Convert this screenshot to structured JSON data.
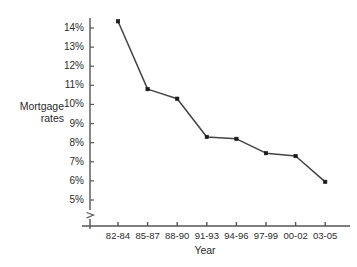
{
  "chart_data": {
    "type": "line",
    "title": "",
    "xlabel": "Year",
    "ylabel": "Mortgage rates",
    "categories": [
      "82-84",
      "85-87",
      "88-90",
      "91-93",
      "94-96",
      "97-99",
      "00-02",
      "03-05"
    ],
    "values": [
      14.35,
      10.8,
      10.3,
      8.3,
      8.2,
      7.45,
      7.3,
      5.95
    ],
    "series": [
      {
        "name": "Mortgage rates",
        "values": [
          14.35,
          10.8,
          10.3,
          8.3,
          8.2,
          7.45,
          7.3,
          5.95
        ]
      }
    ],
    "ytick_labels": [
      "14%",
      "13%",
      "12%",
      "11%",
      "10%",
      "9%",
      "8%",
      "7%",
      "6%",
      "5%"
    ],
    "ytick_values": [
      14,
      13,
      12,
      11,
      10,
      9,
      8,
      7,
      6,
      5
    ],
    "ylim": [
      5,
      14
    ],
    "grid": false,
    "legend": "none",
    "y_axis_break": true,
    "marker": "square",
    "line_color": "#444444",
    "marker_color": "#1a1a1a",
    "axis_color": "#555555",
    "background_color": "#ffffff"
  },
  "axis": {
    "y_title_line1": "Mortgage",
    "y_title_line2": "rates",
    "x_title": "Year"
  }
}
